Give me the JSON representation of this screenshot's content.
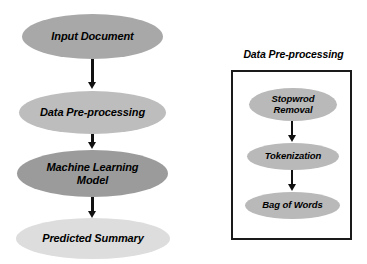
{
  "diagram": {
    "main_flow": {
      "nodes": [
        {
          "id": "input-document",
          "label": "Input Document",
          "fill": "#a8a8a8"
        },
        {
          "id": "data-preprocessing",
          "label": "Data Pre-processing",
          "fill": "#bdbdbd"
        },
        {
          "id": "machine-learning-model",
          "label": "Machine Learning\nModel",
          "line1": "Machine Learning",
          "line2": "Model",
          "fill": "#9b9b9b"
        },
        {
          "id": "predicted-summary",
          "label": "Predicted Summary",
          "fill": "#dddddd"
        }
      ],
      "connectors": [
        {
          "from": "input-document",
          "to": "data-preprocessing",
          "type": "arrow-down"
        },
        {
          "from": "data-preprocessing",
          "to": "machine-learning-model",
          "type": "arrow-down"
        },
        {
          "from": "machine-learning-model",
          "to": "predicted-summary",
          "type": "arrow-down"
        }
      ]
    },
    "detail_panel": {
      "title": "Data Pre-processing",
      "border_color": "#1a1a1a",
      "background": "#ffffff",
      "nodes": [
        {
          "id": "stopword-removal",
          "label": "Stopwrod\nRemoval",
          "line1": "Stopwrod",
          "line2": "Removal",
          "fill": "#b9b9b9"
        },
        {
          "id": "tokenization",
          "label": "Tokenization",
          "fill": "#b9b9b9"
        },
        {
          "id": "bag-of-words",
          "label": "Bag of Words",
          "fill": "#b9b9b9"
        }
      ],
      "connectors": [
        {
          "from": "stopword-removal",
          "to": "tokenization",
          "type": "arrow-down"
        },
        {
          "from": "tokenization",
          "to": "bag-of-words",
          "type": "arrow-down"
        }
      ]
    },
    "colors": {
      "text": "#000000",
      "arrow": "#111111",
      "canvas_background": "#ffffff"
    }
  }
}
